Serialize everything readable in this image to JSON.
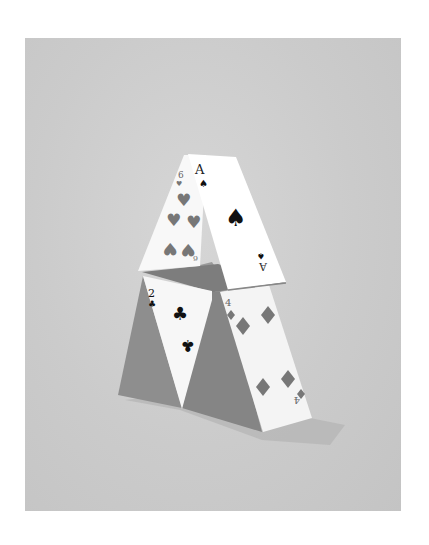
{
  "artwork": {
    "subject": "House of cards illustration",
    "background_color": "#ffffff",
    "panel_color": "#cdcdcd",
    "card_color": "#ffffff",
    "shadow_color": "#8c8c8c",
    "ink_color": "#111111",
    "pip_color": "#7a7a7a"
  },
  "cards": [
    {
      "name": "six-of-hearts",
      "rank": "6",
      "suit": "♥",
      "rank_bottom": "9"
    },
    {
      "name": "ace-of-spades",
      "rank": "A",
      "suit": "♠",
      "rank_bottom": "∀"
    },
    {
      "name": "two-of-clubs",
      "rank": "2",
      "suit": "♣"
    },
    {
      "name": "four-of-diamonds",
      "rank": "4",
      "suit": "♦",
      "rank_bottom": "4"
    }
  ]
}
